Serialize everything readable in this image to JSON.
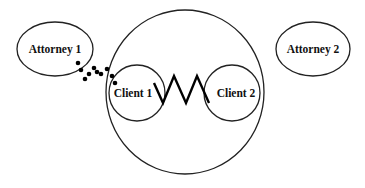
{
  "diagram": {
    "nodes": {
      "attorney1": {
        "label": "Attorney 1",
        "cx": 55,
        "cy": 49,
        "rx": 38,
        "ry": 27
      },
      "attorney2": {
        "label": "Attorney 2",
        "cx": 313,
        "cy": 49,
        "rx": 37,
        "ry": 27
      },
      "relationship": {
        "cx": 185,
        "cy": 92,
        "rx": 79,
        "ry": 82
      },
      "client1": {
        "label": "Client 1",
        "cx": 137,
        "cy": 93,
        "r": 28
      },
      "client2": {
        "label": "Client 2",
        "cx": 232,
        "cy": 93,
        "r": 28
      }
    },
    "edges": [
      {
        "from": "client1",
        "to": "client2",
        "style": "zigzag",
        "meaning": "conflict"
      },
      {
        "from": "attorney1",
        "to": "client1",
        "style": "dotted"
      }
    ],
    "dots": [
      [
        78,
        63
      ],
      [
        81,
        70
      ],
      [
        85,
        79
      ],
      [
        89,
        74
      ],
      [
        94,
        68
      ],
      [
        97,
        72
      ],
      [
        101,
        74
      ],
      [
        107,
        69
      ],
      [
        112,
        76
      ],
      [
        115,
        83
      ]
    ],
    "zigzag_points": "154,83 163,103 174,76 186,103 197,76 209,103"
  }
}
